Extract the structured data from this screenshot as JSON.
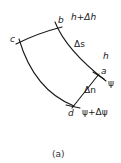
{
  "figure": {
    "caption": "(a)",
    "points": {
      "a": "a",
      "b": "b",
      "c": "c",
      "d": "d"
    },
    "labels": {
      "top_contour": "h+Δh",
      "arc_length": "Δs",
      "contour": "h",
      "streamline": "ψ",
      "normal_spacing": "Δn",
      "next_streamline": "ψ+Δψ"
    },
    "colors": {
      "line": "#1a1a1a",
      "background": "#ffffff"
    }
  }
}
